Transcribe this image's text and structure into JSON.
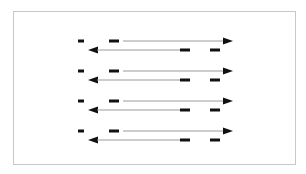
{
  "diagram": {
    "title": "",
    "frame": {
      "x": 13,
      "y": 11,
      "w": 283,
      "h": 154,
      "stroke": "#c8c8c8"
    },
    "colors": {
      "line": "#9a9a9a",
      "arrowhead": "#111111",
      "dash": "#111111"
    },
    "rows": [
      {
        "forward": {
          "y": 41,
          "x1": 123,
          "x2": 233,
          "dashes": [
            [
              78,
              84
            ],
            [
              109,
              119
            ]
          ]
        },
        "reverse": {
          "y": 50,
          "x1": 88,
          "x2": 180,
          "dashes": [
            [
              180,
              190
            ],
            [
              210,
              220
            ]
          ]
        }
      },
      {
        "forward": {
          "y": 71,
          "x1": 123,
          "x2": 233,
          "dashes": [
            [
              78,
              84
            ],
            [
              109,
              119
            ]
          ]
        },
        "reverse": {
          "y": 80,
          "x1": 88,
          "x2": 180,
          "dashes": [
            [
              180,
              190
            ],
            [
              210,
              220
            ]
          ]
        }
      },
      {
        "forward": {
          "y": 101,
          "x1": 123,
          "x2": 233,
          "dashes": [
            [
              78,
              84
            ],
            [
              109,
              119
            ]
          ]
        },
        "reverse": {
          "y": 110,
          "x1": 88,
          "x2": 180,
          "dashes": [
            [
              180,
              190
            ],
            [
              210,
              220
            ]
          ]
        }
      },
      {
        "forward": {
          "y": 131,
          "x1": 123,
          "x2": 233,
          "dashes": [
            [
              78,
              84
            ],
            [
              109,
              119
            ]
          ]
        },
        "reverse": {
          "y": 140,
          "x1": 88,
          "x2": 180,
          "dashes": [
            [
              180,
              190
            ],
            [
              210,
              220
            ]
          ]
        }
      }
    ]
  }
}
